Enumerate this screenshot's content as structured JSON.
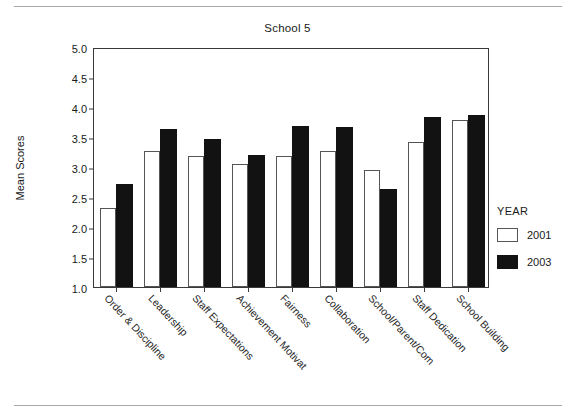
{
  "chart_data": {
    "type": "bar",
    "title": "School 5",
    "xlabel": "",
    "ylabel": "Mean Scores",
    "ylim": [
      1.0,
      5.0
    ],
    "ytick_step": 0.5,
    "yticks": [
      "5.0",
      "4.5",
      "4.0",
      "3.5",
      "3.0",
      "2.5",
      "2.0",
      "1.5",
      "1.0"
    ],
    "grid": false,
    "legend_title": "YEAR",
    "legend_position": "right",
    "categories": [
      "Order & Discipline",
      "Leadership",
      "Staff Expectations",
      "Achievement Motivat",
      "Fairness",
      "Collaboration",
      "School/Parent/Com",
      "Staff Dedication",
      "School Building"
    ],
    "series": [
      {
        "name": "2001",
        "color": "#ffffff",
        "values": [
          2.32,
          3.27,
          3.18,
          3.05,
          3.19,
          3.27,
          2.95,
          3.42,
          3.78
        ]
      },
      {
        "name": "2003",
        "color": "#121212",
        "values": [
          2.72,
          3.63,
          3.47,
          3.2,
          3.69,
          3.66,
          2.64,
          3.83,
          3.87
        ]
      }
    ]
  },
  "legend": {
    "title": "YEAR",
    "entries": [
      {
        "label": "2001",
        "swatch": "white-square-icon"
      },
      {
        "label": "2003",
        "swatch": "black-square-icon"
      }
    ]
  }
}
